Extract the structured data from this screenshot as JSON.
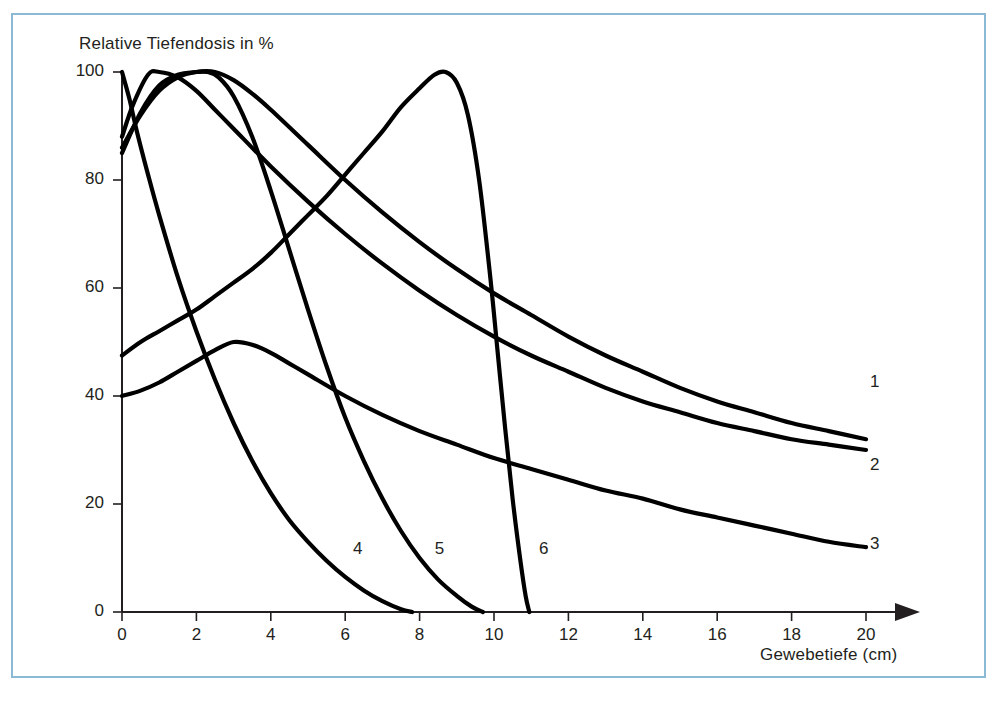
{
  "figure": {
    "frame_color": "#8cb9d4",
    "background": "#ffffff",
    "curve_color": "#000000",
    "axis_color": "#231f20"
  },
  "chart_data": {
    "type": "line",
    "title": "",
    "subtitle": "",
    "xlabel": "Gewebetiefe (cm)",
    "ylabel": "Relative Tiefendosis in %",
    "xlim": [
      0,
      20
    ],
    "ylim": [
      0,
      100
    ],
    "xticks": [
      0,
      2,
      4,
      6,
      8,
      10,
      12,
      14,
      16,
      18,
      20
    ],
    "xtick_labels": [
      "0",
      "2",
      "4",
      "6",
      "8",
      "10",
      "12",
      "14",
      "16",
      "18",
      "20"
    ],
    "yticks": [
      0,
      20,
      40,
      60,
      80,
      100
    ],
    "ytick_labels": [
      "0",
      "20",
      "40",
      "60",
      "80",
      "100"
    ],
    "grid": false,
    "legend_position": "inline-curve-labels",
    "x_axis_arrow": true,
    "annotations": [
      {
        "text": "1",
        "x": 20.0,
        "y": 42.5
      },
      {
        "text": "2",
        "x": 20.0,
        "y": 27.0
      },
      {
        "text": "3",
        "x": 20.0,
        "y": 12.5
      },
      {
        "text": "4",
        "x": 6.1,
        "y": 11.5
      },
      {
        "text": "5",
        "x": 8.3,
        "y": 11.5
      },
      {
        "text": "6",
        "x": 11.1,
        "y": 11.5
      }
    ],
    "series": [
      {
        "name": "1",
        "label": "1",
        "points": [
          [
            0.0,
            40.0
          ],
          [
            0.5,
            41.0
          ],
          [
            1.0,
            42.5
          ],
          [
            1.5,
            44.5
          ],
          [
            2.0,
            46.5
          ],
          [
            2.5,
            48.5
          ],
          [
            3.0,
            50.0
          ],
          [
            3.5,
            49.5
          ],
          [
            4.0,
            48.0
          ],
          [
            4.5,
            46.0
          ],
          [
            5.0,
            44.0
          ],
          [
            6.0,
            40.0
          ],
          [
            7.0,
            36.5
          ],
          [
            8.0,
            33.5
          ],
          [
            9.0,
            31.0
          ],
          [
            10.0,
            28.5
          ],
          [
            11.0,
            26.5
          ],
          [
            12.0,
            24.5
          ],
          [
            13.0,
            22.5
          ],
          [
            14.0,
            21.0
          ],
          [
            15.0,
            19.0
          ],
          [
            16.0,
            17.5
          ],
          [
            17.0,
            16.0
          ],
          [
            18.0,
            14.5
          ],
          [
            19.0,
            13.0
          ],
          [
            20.0,
            12.0
          ]
        ]
      },
      {
        "name": "2",
        "label": "2",
        "points": [
          [
            0.0,
            88.0
          ],
          [
            0.3,
            94.0
          ],
          [
            0.7,
            99.5
          ],
          [
            1.0,
            100.0
          ],
          [
            1.5,
            99.0
          ],
          [
            2.0,
            96.5
          ],
          [
            2.5,
            93.0
          ],
          [
            3.0,
            89.5
          ],
          [
            4.0,
            82.5
          ],
          [
            5.0,
            76.0
          ],
          [
            6.0,
            70.0
          ],
          [
            7.0,
            64.5
          ],
          [
            8.0,
            59.5
          ],
          [
            9.0,
            55.0
          ],
          [
            10.0,
            51.0
          ],
          [
            11.0,
            47.5
          ],
          [
            12.0,
            44.5
          ],
          [
            13.0,
            41.5
          ],
          [
            14.0,
            39.0
          ],
          [
            15.0,
            37.0
          ],
          [
            16.0,
            35.0
          ],
          [
            17.0,
            33.5
          ],
          [
            18.0,
            32.0
          ],
          [
            19.0,
            31.0
          ],
          [
            20.0,
            30.0
          ]
        ]
      },
      {
        "name": "3",
        "label": "3",
        "points": [
          [
            0.0,
            86.0
          ],
          [
            0.5,
            92.0
          ],
          [
            1.0,
            96.5
          ],
          [
            1.5,
            99.0
          ],
          [
            2.0,
            100.0
          ],
          [
            2.5,
            100.0
          ],
          [
            3.0,
            98.5
          ],
          [
            3.5,
            96.0
          ],
          [
            4.0,
            93.0
          ],
          [
            5.0,
            86.5
          ],
          [
            6.0,
            80.0
          ],
          [
            7.0,
            74.0
          ],
          [
            8.0,
            68.5
          ],
          [
            9.0,
            63.5
          ],
          [
            10.0,
            59.0
          ],
          [
            11.0,
            55.0
          ],
          [
            12.0,
            51.0
          ],
          [
            13.0,
            47.5
          ],
          [
            14.0,
            44.5
          ],
          [
            15.0,
            41.5
          ],
          [
            16.0,
            39.0
          ],
          [
            17.0,
            37.0
          ],
          [
            18.0,
            35.0
          ],
          [
            19.0,
            33.5
          ],
          [
            20.0,
            32.0
          ]
        ]
      },
      {
        "name": "4",
        "label": "4",
        "points": [
          [
            0.0,
            100.0
          ],
          [
            0.2,
            95.0
          ],
          [
            0.4,
            89.0
          ],
          [
            0.7,
            81.0
          ],
          [
            1.0,
            73.5
          ],
          [
            1.5,
            62.0
          ],
          [
            2.0,
            52.0
          ],
          [
            2.5,
            43.0
          ],
          [
            3.0,
            35.0
          ],
          [
            3.5,
            28.0
          ],
          [
            4.0,
            22.0
          ],
          [
            4.5,
            17.0
          ],
          [
            5.0,
            13.0
          ],
          [
            5.5,
            9.5
          ],
          [
            6.0,
            6.5
          ],
          [
            6.5,
            4.0
          ],
          [
            7.0,
            2.0
          ],
          [
            7.5,
            0.5
          ],
          [
            7.8,
            0.0
          ]
        ]
      },
      {
        "name": "5",
        "label": "5",
        "points": [
          [
            0.0,
            85.0
          ],
          [
            0.5,
            92.5
          ],
          [
            1.0,
            97.5
          ],
          [
            1.5,
            99.5
          ],
          [
            2.0,
            100.0
          ],
          [
            2.3,
            100.0
          ],
          [
            2.6,
            99.0
          ],
          [
            3.0,
            95.5
          ],
          [
            3.5,
            88.0
          ],
          [
            4.0,
            78.0
          ],
          [
            4.5,
            67.0
          ],
          [
            5.0,
            56.0
          ],
          [
            5.5,
            45.5
          ],
          [
            6.0,
            36.0
          ],
          [
            6.5,
            28.0
          ],
          [
            7.0,
            21.0
          ],
          [
            7.5,
            15.0
          ],
          [
            8.0,
            10.0
          ],
          [
            8.5,
            6.0
          ],
          [
            9.0,
            3.0
          ],
          [
            9.4,
            1.0
          ],
          [
            9.7,
            0.0
          ]
        ]
      },
      {
        "name": "6",
        "label": "6",
        "points": [
          [
            0.0,
            47.5
          ],
          [
            0.5,
            50.0
          ],
          [
            1.0,
            52.0
          ],
          [
            1.5,
            54.0
          ],
          [
            2.0,
            56.0
          ],
          [
            2.5,
            58.5
          ],
          [
            3.0,
            61.0
          ],
          [
            3.5,
            63.5
          ],
          [
            4.0,
            66.5
          ],
          [
            4.5,
            70.0
          ],
          [
            5.0,
            73.5
          ],
          [
            5.5,
            77.0
          ],
          [
            6.0,
            81.0
          ],
          [
            6.5,
            85.0
          ],
          [
            7.0,
            89.0
          ],
          [
            7.5,
            93.5
          ],
          [
            8.0,
            97.0
          ],
          [
            8.4,
            99.5
          ],
          [
            8.7,
            100.0
          ],
          [
            9.0,
            98.0
          ],
          [
            9.3,
            92.0
          ],
          [
            9.6,
            80.0
          ],
          [
            9.9,
            62.0
          ],
          [
            10.1,
            48.0
          ],
          [
            10.3,
            34.0
          ],
          [
            10.5,
            21.0
          ],
          [
            10.7,
            10.0
          ],
          [
            10.85,
            3.0
          ],
          [
            10.95,
            0.0
          ]
        ]
      }
    ]
  }
}
